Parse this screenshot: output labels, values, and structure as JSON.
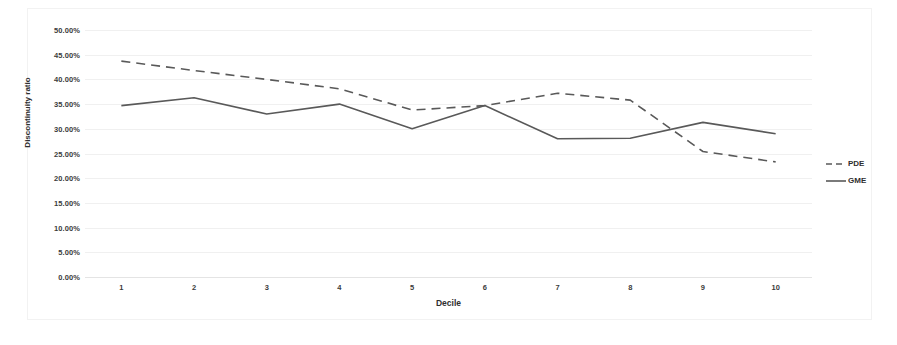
{
  "chart_data": {
    "type": "line",
    "title": "",
    "xlabel": "Decile",
    "ylabel": "Discontinuity ratio",
    "categories": [
      "1",
      "2",
      "3",
      "4",
      "5",
      "6",
      "7",
      "8",
      "9",
      "10"
    ],
    "ylim": [
      0,
      50
    ],
    "ytick_labels": [
      "0.00%",
      "5.00%",
      "10.00%",
      "15.00%",
      "20.00%",
      "25.00%",
      "30.00%",
      "35.00%",
      "40.00%",
      "45.00%",
      "50.00%"
    ],
    "ytick_values": [
      0,
      5,
      10,
      15,
      20,
      25,
      30,
      35,
      40,
      45,
      50
    ],
    "grid": true,
    "legend_position": "right",
    "series": [
      {
        "name": "PDE",
        "style": "dashed",
        "color": "#595959",
        "values": [
          43.7,
          41.8,
          40.0,
          38.1,
          33.8,
          34.7,
          37.2,
          35.8,
          25.4,
          23.3
        ]
      },
      {
        "name": "GME",
        "style": "solid",
        "color": "#595959",
        "values": [
          34.7,
          36.3,
          33.0,
          35.0,
          30.0,
          34.7,
          28.0,
          28.1,
          31.3,
          29.0
        ]
      }
    ]
  },
  "legend": {
    "items": [
      {
        "label": "PDE",
        "style": "dashed"
      },
      {
        "label": "GME",
        "style": "solid"
      }
    ]
  }
}
